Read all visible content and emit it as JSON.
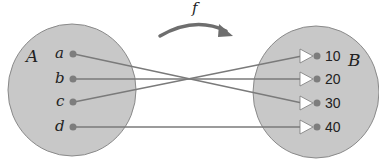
{
  "function": {
    "label": "f",
    "arrow_color": "#6e6e6e"
  },
  "colors": {
    "set_fill": "#c8c8c8",
    "set_stroke": "#8a8a8a",
    "dot": "#7d7d7d",
    "line": "#7a7a7a",
    "arrowhead_fill": "#ffffff"
  },
  "domain_set": {
    "label": "A",
    "elements": [
      "a",
      "b",
      "c",
      "d"
    ]
  },
  "codomain_set": {
    "label": "B",
    "elements": [
      "10",
      "20",
      "30",
      "40"
    ]
  },
  "mapping": [
    {
      "from": "a",
      "to": "30"
    },
    {
      "from": "b",
      "to": "20"
    },
    {
      "from": "c",
      "to": "10"
    },
    {
      "from": "d",
      "to": "40"
    }
  ]
}
